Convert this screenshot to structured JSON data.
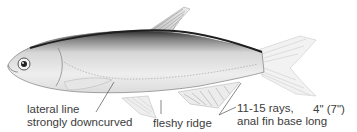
{
  "figure": {
    "annotations": [
      {
        "id": "lateral-line",
        "lines": [
          "lateral line",
          "strongly downcurved"
        ]
      },
      {
        "id": "fleshy-ridge",
        "lines": [
          "fleshy ridge"
        ]
      },
      {
        "id": "anal-fin",
        "lines": [
          "11-15 rays,",
          "anal fin base long"
        ]
      }
    ],
    "size": "4\" (7\")"
  },
  "colors": {
    "background": "#ffffff",
    "text": "#3c3c3c",
    "dorsal_shade": "#2a2a2a",
    "body_light": "#e8e8e8"
  }
}
